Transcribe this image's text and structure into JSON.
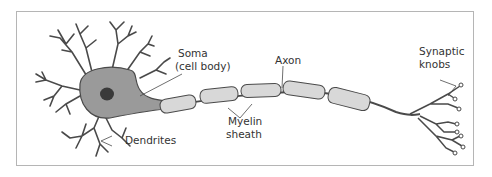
{
  "diagram": {
    "labels": {
      "soma": "Soma",
      "soma_sub": "(cell body)",
      "axon": "Axon",
      "synaptic": "Synaptic",
      "knobs": "knobs",
      "myelin": "Myelin",
      "sheath": "sheath",
      "dendrites": "Dendrites"
    },
    "colors": {
      "soma_fill": "#9a9a9a",
      "nucleus": "#3a3a3a",
      "myelin_fill": "#d8d8d8",
      "stroke": "#4a4a4a",
      "frame": "#b5b5b5"
    }
  }
}
